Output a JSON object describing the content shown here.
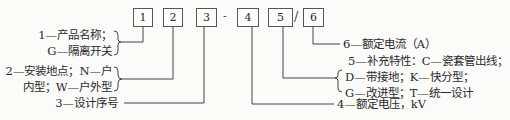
{
  "model_code": {
    "boxes": [
      "1",
      "2",
      "3",
      "4",
      "5",
      "6"
    ],
    "separator_dash": "-",
    "separator_slash": "/"
  },
  "legend": {
    "item1": {
      "line1": "1—产品名称；",
      "line2": "G—隔离开关"
    },
    "item2": {
      "line1": "2—安装地点；N—户",
      "line2": "内型；W—户外型"
    },
    "item3": {
      "line1": "3—设计序号"
    },
    "item4": {
      "line1": "4—额定电压，kV"
    },
    "item5": {
      "line1": "5—补充特性：C—瓷套管出线；",
      "line2": "D—带接地；K—快分型；",
      "line3": "G—改进型；T—统一设计"
    },
    "item6": {
      "line1": "6—额定电流（A）"
    }
  }
}
